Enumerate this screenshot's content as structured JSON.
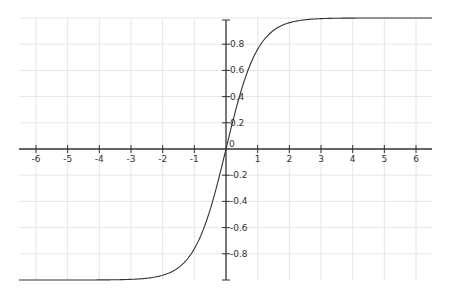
{
  "chart_data": {
    "type": "line",
    "title": "",
    "xlabel": "",
    "ylabel": "",
    "function": "tanh(x)",
    "xlim": [
      -6.55,
      6.5
    ],
    "ylim": [
      -1.0,
      1.0
    ],
    "grid": true,
    "legend": null,
    "x_ticks": [
      -6,
      -5,
      -4,
      -3,
      -2,
      -1,
      0,
      1,
      2,
      3,
      4,
      5,
      6
    ],
    "x_tick_labels": [
      "-6",
      "-5",
      "-4",
      "-3",
      "-2",
      "-1",
      "0",
      "1",
      "2",
      "3",
      "4",
      "5",
      "6"
    ],
    "y_ticks": [
      0.8,
      0.6,
      0.4,
      0.2,
      -0.2,
      -0.4,
      -0.6,
      -0.8
    ],
    "y_tick_labels": [
      "0.8",
      "0.6",
      "0.4",
      "0.2",
      "-0.2",
      "-0.4",
      "-0.6",
      "-0.8"
    ],
    "series": [
      {
        "name": "tanh(x)",
        "color": "#333333",
        "x": [
          -6.5,
          -5,
          -4,
          -3,
          -2.5,
          -2,
          -1.5,
          -1,
          -0.5,
          0,
          0.5,
          1,
          1.5,
          2,
          2.5,
          3,
          4,
          5,
          6.5
        ],
        "y": [
          -1.0,
          -0.9999,
          -0.9993,
          -0.9951,
          -0.9866,
          -0.964,
          -0.9051,
          -0.7616,
          -0.4621,
          0,
          0.4621,
          0.7616,
          0.9051,
          0.964,
          0.9866,
          0.9951,
          0.9993,
          0.9999,
          1.0
        ]
      }
    ]
  },
  "layout": {
    "origin_px": [
      226,
      149
    ],
    "x_unit_px": 31.67,
    "y_unit_px": 131,
    "x_range_px": [
      19,
      432
    ],
    "y_range_px": [
      20,
      280
    ],
    "axis_color": "#333333",
    "grid_color": "#e6e6e6"
  }
}
